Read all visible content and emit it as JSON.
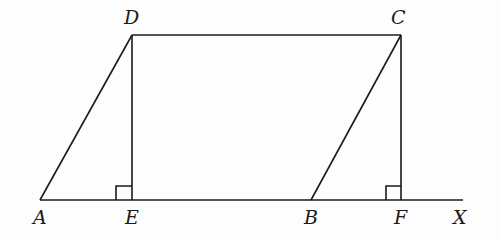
{
  "diagram": {
    "type": "geometry",
    "points": {
      "A": {
        "label": "A",
        "x": 40,
        "y": 200
      },
      "E": {
        "label": "E",
        "x": 132,
        "y": 200
      },
      "B": {
        "label": "B",
        "x": 311,
        "y": 200
      },
      "F": {
        "label": "F",
        "x": 401,
        "y": 200
      },
      "X": {
        "label": "X",
        "x": 463,
        "y": 200
      },
      "D": {
        "label": "D",
        "x": 132,
        "y": 35
      },
      "C": {
        "label": "C",
        "x": 401,
        "y": 35
      }
    },
    "segments": [
      "AX",
      "AD",
      "DC",
      "BC",
      "DE",
      "CF"
    ],
    "right_angles": [
      "DEA",
      "CFX"
    ],
    "line_color": "#1a1a1a"
  }
}
